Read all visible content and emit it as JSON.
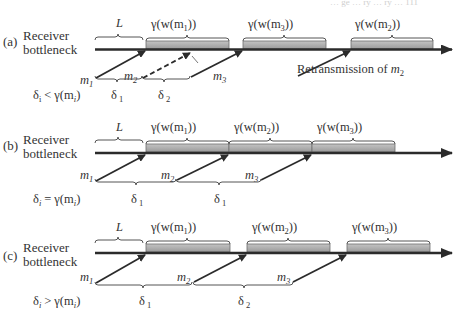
{
  "header_fragment": "… ge … ry … ry … 111",
  "panels": [
    {
      "id": "a",
      "tag": "(a)",
      "row_label_1": "Receiver",
      "row_label_2": "bottleneck",
      "latency_label": "L",
      "condition": "δ_i < γ(m_i)",
      "condition_parts": {
        "lhs": "δ",
        "lhs_sub": "i",
        "op": "<",
        "rhs": "γ(m",
        "rhs_sub": "i",
        "rhs_close": ")"
      },
      "blocks": [
        {
          "label": "γ(w(m",
          "sub": "1",
          "close": "))"
        },
        {
          "label": "γ(w(m",
          "sub": "3",
          "close": "))"
        },
        {
          "label": "γ(w(m",
          "sub": "2",
          "close": "))"
        }
      ],
      "messages": [
        {
          "name": "m",
          "sub": "1",
          "style": "solid"
        },
        {
          "name": "m",
          "sub": "2",
          "style": "dashed",
          "note": "lost"
        },
        {
          "name": "m",
          "sub": "3",
          "style": "solid"
        }
      ],
      "intervals": [
        {
          "name": "δ",
          "sub": "1"
        },
        {
          "name": "δ",
          "sub": "2"
        }
      ],
      "annotation": {
        "text": "Retransmission of ",
        "var": "m",
        "sub": "2"
      }
    },
    {
      "id": "b",
      "tag": "(b)",
      "row_label_1": "Receiver",
      "row_label_2": "bottleneck",
      "latency_label": "L",
      "condition": "δ_i = γ(m_i)",
      "condition_parts": {
        "lhs": "δ",
        "lhs_sub": "i",
        "op": "=",
        "rhs": "γ(m",
        "rhs_sub": "i",
        "rhs_close": ")"
      },
      "blocks": [
        {
          "label": "γ(w(m",
          "sub": "1",
          "close": "))"
        },
        {
          "label": "γ(w(m",
          "sub": "2",
          "close": "))"
        },
        {
          "label": "γ(w(m",
          "sub": "3",
          "close": "))"
        }
      ],
      "messages": [
        {
          "name": "m",
          "sub": "1",
          "style": "solid"
        },
        {
          "name": "m",
          "sub": "2",
          "style": "solid"
        },
        {
          "name": "m",
          "sub": "3",
          "style": "solid"
        }
      ],
      "intervals": [
        {
          "name": "δ",
          "sub": "1"
        },
        {
          "name": "δ",
          "sub": "1"
        }
      ]
    },
    {
      "id": "c",
      "tag": "(c)",
      "row_label_1": "Receiver",
      "row_label_2": "bottleneck",
      "latency_label": "L",
      "condition": "δ_i > γ(m_i)",
      "condition_parts": {
        "lhs": "δ",
        "lhs_sub": "i",
        "op": ">",
        "rhs": "γ(m",
        "rhs_sub": "i",
        "rhs_close": ")"
      },
      "blocks": [
        {
          "label": "γ(w(m",
          "sub": "1",
          "close": "))"
        },
        {
          "label": "γ(w(m",
          "sub": "2",
          "close": "))"
        },
        {
          "label": "γ(w(m",
          "sub": "3",
          "close": "))"
        }
      ],
      "messages": [
        {
          "name": "m",
          "sub": "1",
          "style": "solid"
        },
        {
          "name": "m",
          "sub": "2",
          "style": "solid"
        },
        {
          "name": "m",
          "sub": "3",
          "style": "solid"
        }
      ],
      "intervals": [
        {
          "name": "δ",
          "sub": "1"
        },
        {
          "name": "δ",
          "sub": "2"
        }
      ]
    }
  ],
  "colors": {
    "timeline": "#2b2b2b",
    "block_fill": "#a9a9a9",
    "block_edge": "#6e6e6e",
    "brace": "#555555",
    "text": "#333333"
  }
}
